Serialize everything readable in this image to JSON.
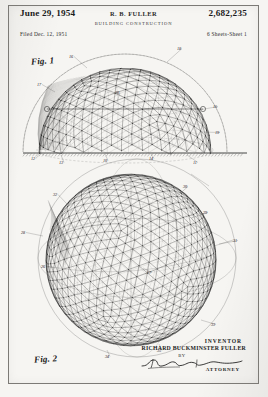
{
  "document": {
    "type": "patent-drawing-sheet",
    "header": {
      "date": "June 29, 1954",
      "inventor_initials": "R. B. FULLER",
      "patent_number": "2,682,235",
      "title": "BUILDING CONSTRUCTION",
      "filed": "Filed Dec. 12, 1951",
      "sheets": "6 Sheets-Sheet 1"
    },
    "figures": [
      {
        "id": "fig1",
        "label": "Fig. 1",
        "description": "Hemispherical geodesic dome shown in elevation resting on a ground line, with triangulated lattice framework and phantom outline of a full sphere.",
        "reference_numerals": [
          "10",
          "11",
          "12",
          "13",
          "14",
          "15",
          "16",
          "17",
          "18",
          "19",
          "20",
          "21",
          "22",
          "23"
        ]
      },
      {
        "id": "fig2",
        "label": "Fig. 2",
        "description": "Complete geodesic spherical structure with triangulated great-circle lattice and surrounding phantom great circles.",
        "reference_numerals": [
          "24",
          "25",
          "26",
          "27",
          "28",
          "29",
          "30",
          "31",
          "32",
          "33",
          "34",
          "35"
        ]
      }
    ],
    "signature_block": {
      "inventor_label": "INVENTOR",
      "inventor_name": "RICHARD BUCKMINSTER FULLER",
      "by_label": "BY",
      "signature": "attorney-signature",
      "attorney_label": "ATTORNEY"
    },
    "colors": {
      "paper": "#f6f5f2",
      "ink": "#1a1a1a",
      "frame": "#7c7a76",
      "faint_ink": "#5a5a58"
    }
  }
}
